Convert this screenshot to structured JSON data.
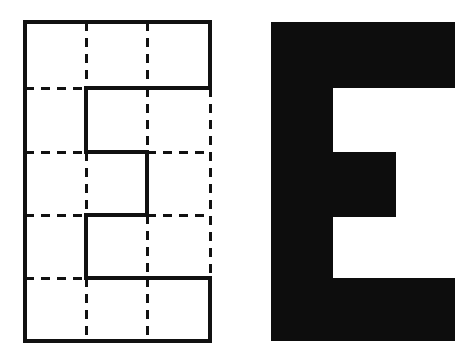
{
  "figure": {
    "title": "Block letter E shown as a grid-traced outline and as a solid silhouette",
    "background_color": "#ffffff",
    "ink_color": "#101010",
    "width": 473,
    "height": 364,
    "panel_count": 2
  },
  "left_panel": {
    "name": "grid-outline-panel",
    "caption": "",
    "description": "Rectangular grid with dashed interior gridlines and a solid E-shaped outline",
    "stroke_color": "#111111",
    "solid_stroke_width": 3.2,
    "dashed_stroke_width": 3.0,
    "dash_pattern": "9 7",
    "bounds": {
      "x": 25,
      "y": 22,
      "width": 185,
      "height": 319
    },
    "grid": {
      "columns": 3,
      "rows": 5,
      "column_x": [
        25,
        86,
        147,
        210
      ],
      "row_y": [
        22,
        88,
        152,
        215,
        278,
        341
      ]
    },
    "dashed_segments": [
      {
        "name": "v-grid-col1",
        "x1": 86,
        "y1": 22,
        "x2": 86,
        "y2": 88
      },
      {
        "name": "v-grid-col2",
        "x1": 147,
        "y1": 22,
        "x2": 147,
        "y2": 88
      },
      {
        "name": "v-grid-col1-mid",
        "x1": 86,
        "y1": 152,
        "x2": 86,
        "y2": 215
      },
      {
        "name": "v-grid-col2-upper",
        "x1": 147,
        "y1": 88,
        "x2": 147,
        "y2": 152
      },
      {
        "name": "v-grid-col2-lower",
        "x1": 147,
        "y1": 215,
        "x2": 147,
        "y2": 278
      },
      {
        "name": "v-grid-right-upper",
        "x1": 210,
        "y1": 88,
        "x2": 210,
        "y2": 278
      },
      {
        "name": "v-grid-col1-bottom",
        "x1": 86,
        "y1": 278,
        "x2": 86,
        "y2": 341
      },
      {
        "name": "v-grid-col2-bottom",
        "x1": 147,
        "y1": 278,
        "x2": 147,
        "y2": 341
      },
      {
        "name": "h-grid-row1-left",
        "x1": 25,
        "y1": 88,
        "x2": 86,
        "y2": 88
      },
      {
        "name": "h-grid-row2-left",
        "x1": 25,
        "y1": 152,
        "x2": 86,
        "y2": 152
      },
      {
        "name": "h-grid-row2-right",
        "x1": 147,
        "y1": 152,
        "x2": 210,
        "y2": 152
      },
      {
        "name": "h-grid-row3-left",
        "x1": 25,
        "y1": 215,
        "x2": 86,
        "y2": 215
      },
      {
        "name": "h-grid-row3-right",
        "x1": 147,
        "y1": 215,
        "x2": 210,
        "y2": 215
      },
      {
        "name": "h-grid-row4-left",
        "x1": 25,
        "y1": 278,
        "x2": 86,
        "y2": 278
      }
    ],
    "solid_segments": [
      {
        "name": "outer-top",
        "x1": 25,
        "y1": 22,
        "x2": 210,
        "y2": 22
      },
      {
        "name": "outer-left",
        "x1": 25,
        "y1": 22,
        "x2": 25,
        "y2": 341
      },
      {
        "name": "outer-bottom",
        "x1": 25,
        "y1": 341,
        "x2": 210,
        "y2": 341
      },
      {
        "name": "outer-right-top",
        "x1": 210,
        "y1": 22,
        "x2": 210,
        "y2": 88
      },
      {
        "name": "outer-right-bottom",
        "x1": 210,
        "y1": 278,
        "x2": 210,
        "y2": 341
      },
      {
        "name": "e-top-arm-underside",
        "x1": 86,
        "y1": 88,
        "x2": 210,
        "y2": 88
      },
      {
        "name": "e-stem-upper",
        "x1": 86,
        "y1": 88,
        "x2": 86,
        "y2": 152
      },
      {
        "name": "e-mid-arm-top",
        "x1": 86,
        "y1": 152,
        "x2": 147,
        "y2": 152
      },
      {
        "name": "e-mid-arm-end",
        "x1": 147,
        "y1": 152,
        "x2": 147,
        "y2": 215
      },
      {
        "name": "e-mid-arm-bottom",
        "x1": 86,
        "y1": 215,
        "x2": 147,
        "y2": 215
      },
      {
        "name": "e-stem-lower",
        "x1": 86,
        "y1": 215,
        "x2": 86,
        "y2": 278
      },
      {
        "name": "e-bottom-arm-top",
        "x1": 86,
        "y1": 278,
        "x2": 210,
        "y2": 278
      }
    ]
  },
  "right_panel": {
    "name": "solid-letter-panel",
    "caption": "",
    "description": "Solid black block capital letter E",
    "letter": "E",
    "fill_color": "#0d0d0d",
    "bounds": {
      "x": 271,
      "y": 22,
      "width": 184,
      "height": 319
    },
    "geometry": {
      "stem_right_x": 333,
      "top_arm_right_x": 455,
      "mid_arm_right_x": 396,
      "bottom_arm_right_x": 455,
      "top_arm_bottom_y": 88,
      "mid_arm_top_y": 152,
      "mid_arm_bottom_y": 217,
      "bottom_arm_top_y": 278
    },
    "outline_path": "M271,22 L455,22 L455,88 L333,88 L333,152 L396,152 L396,217 L333,217 L333,278 L455,278 L455,341 L271,341 Z"
  }
}
